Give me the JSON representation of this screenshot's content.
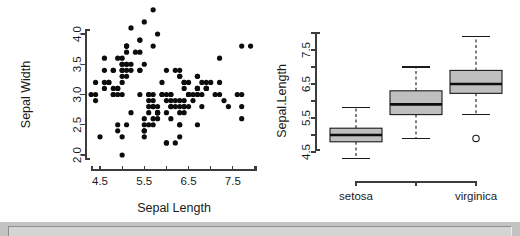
{
  "window": {
    "chrome_bar_name": "window-bottom-chrome"
  },
  "chart_data": [
    {
      "type": "scatter",
      "title": "",
      "xlabel": "Sepal Length",
      "ylabel": "Sepal Width",
      "xlim": [
        4.2,
        8.1
      ],
      "ylim": [
        1.9,
        4.45
      ],
      "grid": false,
      "legend": "none",
      "xticks": [
        4.5,
        5.0,
        5.5,
        6.0,
        6.5,
        7.0,
        7.5,
        8.0
      ],
      "xticklabels": [
        "4.5",
        "",
        "5.5",
        "",
        "6.5",
        "",
        "7.5",
        ""
      ],
      "yticks": [
        2.0,
        2.5,
        3.0,
        3.5,
        4.0
      ],
      "yticklabels": [
        "2.0",
        "2.5",
        "3.0",
        "3.5",
        "4.0"
      ],
      "marker": "filled-circle",
      "marker_color": "#0d0d0d",
      "points": [
        [
          5.1,
          3.5
        ],
        [
          4.9,
          3.0
        ],
        [
          4.7,
          3.2
        ],
        [
          4.6,
          3.1
        ],
        [
          5.0,
          3.6
        ],
        [
          5.4,
          3.9
        ],
        [
          4.6,
          3.4
        ],
        [
          5.0,
          3.4
        ],
        [
          4.4,
          2.9
        ],
        [
          4.9,
          3.1
        ],
        [
          5.4,
          3.7
        ],
        [
          4.8,
          3.4
        ],
        [
          4.8,
          3.0
        ],
        [
          4.3,
          3.0
        ],
        [
          5.8,
          4.0
        ],
        [
          5.7,
          4.4
        ],
        [
          5.4,
          3.9
        ],
        [
          5.1,
          3.5
        ],
        [
          5.7,
          3.8
        ],
        [
          5.1,
          3.8
        ],
        [
          5.4,
          3.4
        ],
        [
          5.1,
          3.7
        ],
        [
          4.6,
          3.6
        ],
        [
          5.1,
          3.3
        ],
        [
          4.8,
          3.4
        ],
        [
          5.0,
          3.0
        ],
        [
          5.0,
          3.4
        ],
        [
          5.2,
          3.5
        ],
        [
          5.2,
          3.4
        ],
        [
          4.7,
          3.2
        ],
        [
          4.8,
          3.1
        ],
        [
          5.4,
          3.4
        ],
        [
          5.2,
          4.1
        ],
        [
          5.5,
          4.2
        ],
        [
          4.9,
          3.1
        ],
        [
          5.0,
          3.2
        ],
        [
          5.5,
          3.5
        ],
        [
          4.9,
          3.6
        ],
        [
          4.4,
          3.0
        ],
        [
          5.1,
          3.4
        ],
        [
          5.0,
          3.5
        ],
        [
          4.5,
          2.3
        ],
        [
          4.4,
          3.2
        ],
        [
          5.0,
          3.5
        ],
        [
          5.1,
          3.8
        ],
        [
          4.8,
          3.0
        ],
        [
          5.1,
          3.8
        ],
        [
          4.6,
          3.2
        ],
        [
          5.3,
          3.7
        ],
        [
          5.0,
          3.3
        ],
        [
          7.0,
          3.2
        ],
        [
          6.4,
          3.2
        ],
        [
          6.9,
          3.1
        ],
        [
          5.5,
          2.3
        ],
        [
          6.5,
          2.8
        ],
        [
          5.7,
          2.8
        ],
        [
          6.3,
          3.3
        ],
        [
          4.9,
          2.4
        ],
        [
          6.6,
          2.9
        ],
        [
          5.2,
          2.7
        ],
        [
          5.0,
          2.0
        ],
        [
          5.9,
          3.0
        ],
        [
          6.0,
          2.2
        ],
        [
          6.1,
          2.9
        ],
        [
          5.6,
          2.9
        ],
        [
          6.7,
          3.1
        ],
        [
          5.6,
          3.0
        ],
        [
          5.8,
          2.7
        ],
        [
          6.2,
          2.2
        ],
        [
          5.6,
          2.5
        ],
        [
          5.9,
          3.2
        ],
        [
          6.1,
          2.8
        ],
        [
          6.3,
          2.5
        ],
        [
          6.1,
          2.8
        ],
        [
          6.4,
          2.9
        ],
        [
          6.6,
          3.0
        ],
        [
          6.8,
          2.8
        ],
        [
          6.7,
          3.0
        ],
        [
          6.0,
          2.9
        ],
        [
          5.7,
          2.6
        ],
        [
          5.5,
          2.4
        ],
        [
          5.5,
          2.4
        ],
        [
          5.8,
          2.7
        ],
        [
          6.0,
          2.7
        ],
        [
          5.4,
          3.0
        ],
        [
          6.0,
          3.4
        ],
        [
          6.7,
          3.1
        ],
        [
          6.3,
          2.3
        ],
        [
          5.6,
          3.0
        ],
        [
          5.5,
          2.5
        ],
        [
          5.5,
          2.6
        ],
        [
          6.1,
          3.0
        ],
        [
          5.8,
          2.6
        ],
        [
          5.0,
          2.3
        ],
        [
          5.6,
          2.7
        ],
        [
          5.7,
          3.0
        ],
        [
          5.7,
          2.9
        ],
        [
          6.2,
          2.9
        ],
        [
          5.1,
          2.5
        ],
        [
          5.7,
          2.8
        ],
        [
          6.3,
          3.3
        ],
        [
          5.8,
          2.7
        ],
        [
          7.1,
          3.0
        ],
        [
          6.3,
          2.9
        ],
        [
          6.5,
          3.0
        ],
        [
          7.6,
          3.0
        ],
        [
          4.9,
          2.5
        ],
        [
          7.3,
          2.9
        ],
        [
          6.7,
          2.5
        ],
        [
          7.2,
          3.6
        ],
        [
          6.5,
          3.2
        ],
        [
          6.4,
          2.7
        ],
        [
          6.8,
          3.0
        ],
        [
          5.7,
          2.5
        ],
        [
          5.8,
          2.8
        ],
        [
          6.4,
          3.2
        ],
        [
          6.5,
          3.0
        ],
        [
          7.7,
          3.8
        ],
        [
          7.7,
          2.6
        ],
        [
          6.0,
          2.2
        ],
        [
          6.9,
          3.2
        ],
        [
          5.6,
          2.8
        ],
        [
          7.7,
          2.8
        ],
        [
          6.3,
          2.7
        ],
        [
          6.7,
          3.3
        ],
        [
          7.2,
          3.2
        ],
        [
          6.2,
          2.8
        ],
        [
          6.1,
          3.0
        ],
        [
          6.4,
          2.8
        ],
        [
          7.2,
          3.0
        ],
        [
          7.4,
          2.8
        ],
        [
          7.9,
          3.8
        ],
        [
          6.4,
          2.8
        ],
        [
          6.3,
          2.8
        ],
        [
          6.1,
          2.6
        ],
        [
          7.7,
          3.0
        ],
        [
          6.3,
          3.4
        ],
        [
          6.4,
          3.1
        ],
        [
          6.0,
          3.0
        ],
        [
          6.9,
          3.1
        ],
        [
          6.7,
          3.1
        ],
        [
          6.9,
          3.1
        ],
        [
          5.8,
          2.7
        ],
        [
          6.8,
          3.2
        ],
        [
          6.7,
          3.3
        ],
        [
          6.7,
          3.0
        ],
        [
          6.3,
          2.5
        ],
        [
          6.5,
          3.0
        ],
        [
          6.2,
          3.4
        ],
        [
          5.9,
          3.0
        ]
      ]
    },
    {
      "type": "boxplot",
      "title": "",
      "xlabel": "",
      "ylabel": "Sepal.Length",
      "ylim": [
        4.2,
        8.05
      ],
      "grid": false,
      "legend": "none",
      "yticks": [
        4.5,
        5.0,
        5.5,
        6.0,
        6.5,
        7.0,
        7.5,
        8.0
      ],
      "yticklabels": [
        "4.5",
        "",
        "5.5",
        "",
        "6.5",
        "",
        "7.5",
        ""
      ],
      "categories": [
        "setosa",
        "",
        "virginica"
      ],
      "categories_full": [
        "setosa",
        "versicolor",
        "virginica"
      ],
      "box_fill": "#bfbfbf",
      "boxes": [
        {
          "name": "setosa",
          "lower_whisker": 4.3,
          "q1": 4.8,
          "median": 5.0,
          "q3": 5.2,
          "upper_whisker": 5.8,
          "outliers": []
        },
        {
          "name": "versicolor",
          "lower_whisker": 4.9,
          "q1": 5.6,
          "median": 5.9,
          "q3": 6.3,
          "upper_whisker": 7.0,
          "outliers": []
        },
        {
          "name": "virginica",
          "lower_whisker": 5.6,
          "q1": 6.225,
          "median": 6.5,
          "q3": 6.9,
          "upper_whisker": 7.9,
          "outliers": [
            4.9
          ]
        }
      ]
    }
  ]
}
